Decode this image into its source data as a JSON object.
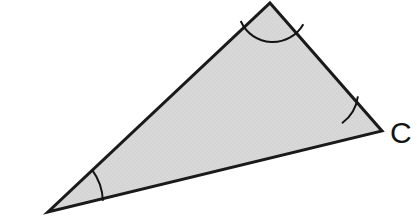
{
  "figure": {
    "kind": "geometry-diagram",
    "shape": "triangle",
    "background_color": "#ffffff",
    "fill_color": "#d6d6d6",
    "stroke_color": "#1a1a1a",
    "stroke_width": 3,
    "arc_stroke_color": "#141414",
    "arc_stroke_width": 2,
    "label_color": "#141414",
    "label_font_size": 30,
    "canvas": {
      "width": 417,
      "height": 216
    },
    "vertices": [
      {
        "id": "A",
        "name": "apex-vertex",
        "x": 270,
        "y": 3,
        "label": "",
        "labeled": false
      },
      {
        "id": "C",
        "name": "right-vertex",
        "x": 382,
        "y": 131,
        "label": "C",
        "labeled": true,
        "label_x": 390,
        "label_y": 143
      },
      {
        "id": "B",
        "name": "bottom-left-vertex",
        "x": 48,
        "y": 212,
        "label": "B",
        "labeled": true,
        "label_clipped": true,
        "label_x": 26,
        "label_y": 239
      }
    ],
    "edges": [
      {
        "name": "edge-apex-to-right",
        "from": "A",
        "to": "C"
      },
      {
        "name": "edge-right-to-bottom-left",
        "from": "C",
        "to": "B"
      },
      {
        "name": "edge-bottom-left-to-apex",
        "from": "B",
        "to": "A"
      }
    ],
    "angle_arcs": [
      {
        "name": "angle-arc-apex",
        "vertex": "A",
        "radius": 35,
        "path": "M 240.7 21.0 A 35 35 0 0 0 303.3 24.2"
      },
      {
        "name": "angle-arc-right",
        "vertex": "C",
        "radius": 40,
        "path": "M 342.0 123.2 A 40 40 0 0 0 357.9 96.3"
      },
      {
        "name": "angle-arc-bottom-left",
        "vertex": "B",
        "radius": 55,
        "path": "M 102.9 200.8 A 55 55 0 0 0 92.1 169.9"
      }
    ],
    "polygon_points": "270,3 382,131 48,212"
  }
}
